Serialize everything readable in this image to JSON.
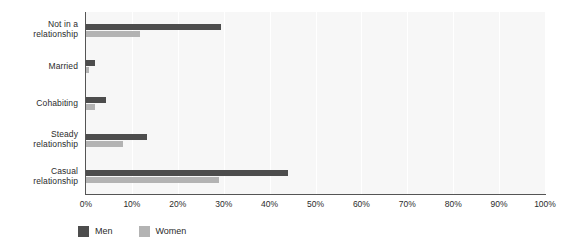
{
  "chart_data": {
    "type": "bar",
    "orientation": "horizontal",
    "title": "",
    "xlabel": "",
    "ylabel": "",
    "xlim": [
      0,
      100
    ],
    "xtick_labels": [
      "0%",
      "10%",
      "20%",
      "30%",
      "40%",
      "50%",
      "60%",
      "70%",
      "80%",
      "90%",
      "100%"
    ],
    "xtick_values": [
      0,
      10,
      20,
      30,
      40,
      50,
      60,
      70,
      80,
      90,
      100
    ],
    "grid": "vertical",
    "legend_position": "bottom-left",
    "categories": [
      "Not in a relationship",
      "Married",
      "Cohabiting",
      "Steady relationship",
      "Casual relationship"
    ],
    "category_lines": [
      [
        "Not in a",
        "relationship"
      ],
      [
        "Married"
      ],
      [
        "Cohabiting"
      ],
      [
        "Steady",
        "relationship"
      ],
      [
        "Casual",
        "relationship"
      ]
    ],
    "series": [
      {
        "name": "Men",
        "color": "#4d4d4d",
        "values": [
          29.5,
          2.0,
          4.3,
          13.3,
          44.0
        ]
      },
      {
        "name": "Women",
        "color": "#b3b3b3",
        "values": [
          11.8,
          0.6,
          2.0,
          8.0,
          29.0
        ]
      }
    ]
  },
  "legend": {
    "items": [
      {
        "label": "Men",
        "color": "#4d4d4d"
      },
      {
        "label": "Women",
        "color": "#b3b3b3"
      }
    ]
  }
}
